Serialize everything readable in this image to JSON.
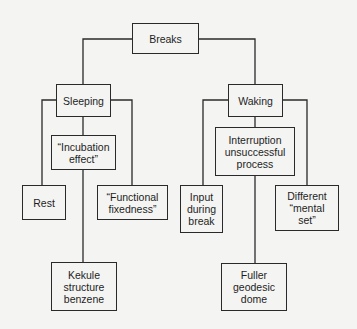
{
  "diagram": {
    "type": "tree",
    "root": {
      "label": "Breaks",
      "children": [
        {
          "label": "Sleeping",
          "children": [
            {
              "label": "Rest"
            },
            {
              "label": "“Incubation\neffect”",
              "children": [
                {
                  "label": "Kekule\nstructure\nbenzene"
                }
              ]
            },
            {
              "label": "“Functional\nfixedness”"
            }
          ]
        },
        {
          "label": "Waking",
          "children": [
            {
              "label": "Input\nduring\nbreak"
            },
            {
              "label": "Interruption\nunsuccessful\nprocess",
              "children": [
                {
                  "label": "Fuller\ngeodesic\ndome"
                }
              ]
            },
            {
              "label": "Different\n“mental\nset”"
            }
          ]
        }
      ]
    }
  },
  "nodes": {
    "breaks": "Breaks",
    "sleeping": "Sleeping",
    "waking": "Waking",
    "rest": "Rest",
    "incubation": "“Incubation\neffect”",
    "functional": "“Functional\nfixedness”",
    "kekule": "Kekule\nstructure\nbenzene",
    "input": "Input\nduring\nbreak",
    "interruption": "Interruption\nunsuccessful\nprocess",
    "different": "Different\n“mental\nset”",
    "fuller": "Fuller\ngeodesic\ndome"
  },
  "colors": {
    "line": "#2a2a2a",
    "background": "#f4f4f2",
    "text": "#1e1e1e"
  }
}
